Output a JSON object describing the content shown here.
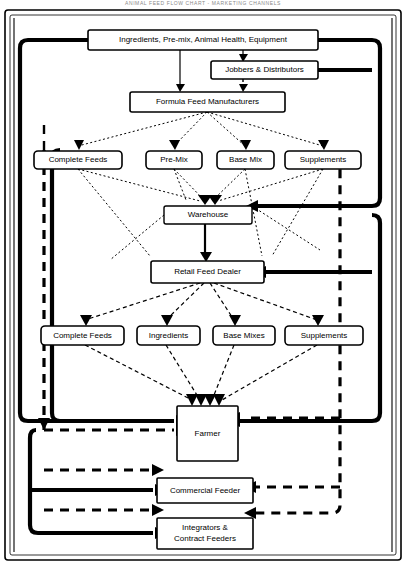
{
  "diagram": {
    "title": "ANIMAL FEED FLOW CHART - MARKETING CHANNELS",
    "frame_label": "outer-frame",
    "nodes": [
      {
        "id": "ingredients",
        "label": "Ingredients, Pre-mix, Animal Health, Equipment",
        "x": 88,
        "y": 30,
        "w": 230,
        "h": 20,
        "fontsize": 8,
        "radius": 2,
        "stroke": 1.6
      },
      {
        "id": "jobbers",
        "label": "Jobbers & Distributors",
        "x": 211,
        "y": 61,
        "w": 107,
        "h": 18,
        "fontsize": 8,
        "radius": 2,
        "stroke": 1.6
      },
      {
        "id": "formula",
        "label": "Formula Feed Manufacturers",
        "x": 130,
        "y": 92,
        "w": 155,
        "h": 20,
        "fontsize": 8,
        "radius": 2,
        "stroke": 1.6
      },
      {
        "id": "mfr-complete",
        "label": "Complete Feeds",
        "x": 34,
        "y": 151,
        "w": 88,
        "h": 18,
        "fontsize": 8,
        "radius": 4,
        "stroke": 1.6
      },
      {
        "id": "mfr-premix",
        "label": "Pre-Mix",
        "x": 146,
        "y": 151,
        "w": 56,
        "h": 18,
        "fontsize": 8,
        "radius": 4,
        "stroke": 1.6
      },
      {
        "id": "mfr-basemix",
        "label": "Base Mix",
        "x": 217,
        "y": 151,
        "w": 57,
        "h": 18,
        "fontsize": 8,
        "radius": 4,
        "stroke": 1.6
      },
      {
        "id": "mfr-supp",
        "label": "Supplements",
        "x": 285,
        "y": 151,
        "w": 76,
        "h": 18,
        "fontsize": 8,
        "radius": 4,
        "stroke": 1.6
      },
      {
        "id": "warehouse",
        "label": "Warehouse",
        "x": 164,
        "y": 206,
        "w": 88,
        "h": 18,
        "fontsize": 8,
        "radius": 2,
        "stroke": 1.4
      },
      {
        "id": "retail",
        "label": "Retail Feed Dealer",
        "x": 151,
        "y": 261,
        "w": 113,
        "h": 22,
        "fontsize": 8,
        "radius": 2,
        "stroke": 1.6
      },
      {
        "id": "rd-complete",
        "label": "Complete Feeds",
        "x": 41,
        "y": 326,
        "w": 83,
        "h": 19,
        "fontsize": 8,
        "radius": 4,
        "stroke": 1.6
      },
      {
        "id": "rd-ingredients",
        "label": "Ingredients",
        "x": 137,
        "y": 326,
        "w": 63,
        "h": 19,
        "fontsize": 8,
        "radius": 4,
        "stroke": 1.6
      },
      {
        "id": "rd-basemixes",
        "label": "Base Mixes",
        "x": 213,
        "y": 326,
        "w": 62,
        "h": 19,
        "fontsize": 8,
        "radius": 4,
        "stroke": 1.6
      },
      {
        "id": "rd-supp",
        "label": "Supplements",
        "x": 285,
        "y": 326,
        "w": 78,
        "h": 19,
        "fontsize": 8,
        "radius": 4,
        "stroke": 1.6
      },
      {
        "id": "farmer",
        "label": "Farmer",
        "x": 177,
        "y": 406,
        "w": 61,
        "h": 55,
        "fontsize": 8,
        "radius": 1,
        "stroke": 1.6
      },
      {
        "id": "commercial",
        "label": "Commercial Feeder",
        "x": 157,
        "y": 478,
        "w": 96,
        "h": 25,
        "fontsize": 8,
        "radius": 1,
        "stroke": 1.6
      },
      {
        "id": "integrators",
        "label": "Integrators &|Contract Feeders",
        "x": 157,
        "y": 518,
        "w": 96,
        "h": 31,
        "fontsize": 8,
        "radius": 1,
        "stroke": 1.6
      }
    ],
    "legend": {
      "solid": "solid-flow-line",
      "dashed": "dashed-flow-line",
      "dotted": "dotted-flow-line"
    },
    "colors": {
      "line": "#000000",
      "bg": "#ffffff",
      "title": "#8a8a8a"
    }
  }
}
